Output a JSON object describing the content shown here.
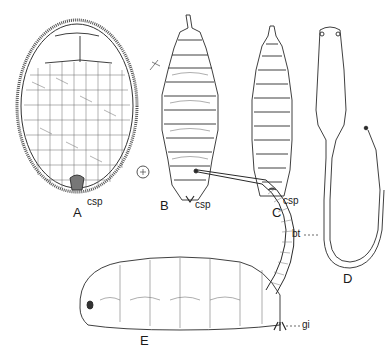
{
  "figure": {
    "panels": [
      {
        "id": "A",
        "label": "A",
        "description": "puparium, ventral view with polygonal cuticle pattern"
      },
      {
        "id": "B",
        "label": "B",
        "description": "larva, segmented body, dorsal view"
      },
      {
        "id": "C",
        "label": "C",
        "description": "larva, tapered segmented body"
      },
      {
        "id": "D",
        "label": "D",
        "description": "larva with long breathing tube"
      },
      {
        "id": "E",
        "label": "E",
        "description": "rat-tailed larva, lateral view"
      }
    ],
    "annotations": {
      "csp_a": "csp",
      "csp_b": "csp",
      "csp_c": "csp",
      "bt": "bt",
      "gi": "gi"
    },
    "stroke_color": "#2a2a2a",
    "background_color": "#ffffff"
  }
}
